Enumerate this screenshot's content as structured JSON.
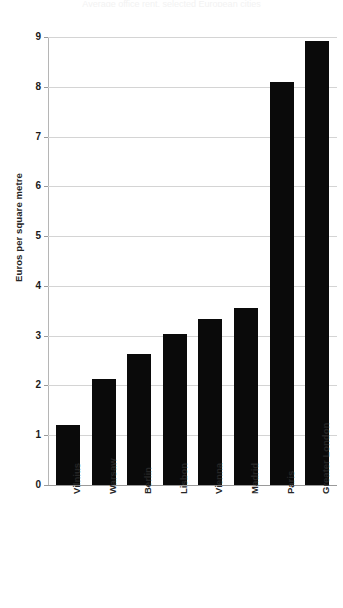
{
  "chart_data": {
    "type": "bar",
    "title": "",
    "xlabel": "",
    "ylabel": "Euros per square metre",
    "categories": [
      "Vilnius",
      "Warsaw",
      "Berlin",
      "Lisbon",
      "Vienna",
      "Madrid",
      "Paris",
      "Greater London"
    ],
    "values": [
      1.2,
      2.12,
      2.63,
      3.03,
      3.33,
      3.55,
      8.1,
      8.92
    ],
    "ylim": [
      0,
      9
    ],
    "ytick_labels": [
      "0",
      "1",
      "2",
      "3",
      "4",
      "5",
      "6",
      "7",
      "8",
      "9"
    ],
    "ytick_values": [
      0,
      1,
      2,
      3,
      4,
      5,
      6,
      7,
      8,
      9
    ],
    "grid": true,
    "legend": false,
    "bar_color": "#0a0a0a",
    "grid_color": "#d4d4d4",
    "axis_color": "#9a9a9a"
  },
  "figure": {
    "title_remnant": "Average office rent, selected European cities"
  }
}
